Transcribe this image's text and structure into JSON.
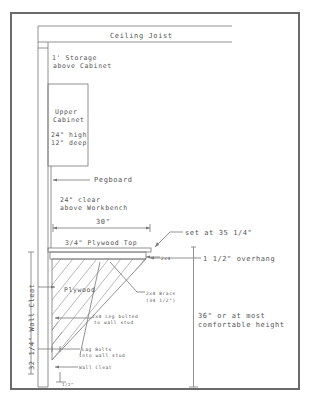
{
  "drawing": {
    "title": "Workbench and Cabinet Wall Elevation",
    "labels": {
      "ceiling_joist": "Ceiling Joist",
      "storage_line1": "1' Storage",
      "storage_line2": "above Cabinet",
      "cabinet_line1": "Upper",
      "cabinet_line2": "Cabinet",
      "cabinet_line3": "24\" high",
      "cabinet_line4": "12\" deep",
      "pegboard": "Pegboard",
      "clear_line1": "24\" clear",
      "clear_line2": "above Workbench",
      "depth": "30\"",
      "top_height": "set at 35 1/4\"",
      "plywood_top": "3/4\" Plywood Top",
      "overhang": "1 1/2\" overhang",
      "two_by_four": "2x4",
      "plywood": "Plywood",
      "brace_line1": "2x4 Brace",
      "brace_line2": "(34 1/2\")",
      "leg_line1": "2x4 Leg bolted",
      "leg_line2": "to wall stud",
      "lag_line1": "Lag Bolts",
      "lag_line2": "into wall stud",
      "wall_cleat": "Wall Cleat",
      "wall_cleat_height": "32 1/4\" Wall Cleat",
      "floor_gap": "1/2\"",
      "bench_height_line1": "36\" or at most",
      "bench_height_line2": "comfortable height"
    },
    "colors": {
      "line": "#777777",
      "text": "#555555",
      "frame": "#6a6a6a"
    }
  }
}
